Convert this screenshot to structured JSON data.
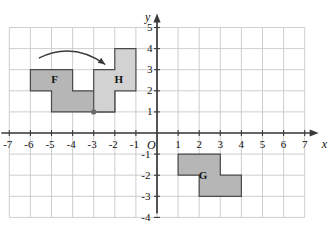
{
  "figure": {
    "kind": "coordinate-plane-transformation-diagram",
    "background_color": "#ffffff",
    "grid_color": "#c8c8c8",
    "axis_color": "#3a3a3a",
    "text_color": "#111111"
  },
  "axes": {
    "x_label": "x",
    "y_label": "y",
    "origin_label": "O",
    "x_min": -7,
    "x_max": 7,
    "y_min": -4,
    "y_max": 5,
    "x_ticks": [
      "-7",
      "-6",
      "-5",
      "-4",
      "-3",
      "-2",
      "-1",
      "1",
      "2",
      "3",
      "4",
      "5",
      "6",
      "7"
    ],
    "x_tick_values": [
      -7,
      -6,
      -5,
      -4,
      -3,
      -2,
      -1,
      1,
      2,
      3,
      4,
      5,
      6,
      7
    ],
    "y_ticks": [
      "5",
      "4",
      "3",
      "2",
      "1",
      "-1",
      "-2",
      "-3",
      "-4"
    ],
    "y_tick_values": [
      5,
      4,
      3,
      2,
      1,
      -1,
      -2,
      -3,
      -4
    ],
    "grid": true,
    "grid_x_range": [
      -7,
      7
    ],
    "grid_y_range": [
      -4,
      5
    ]
  },
  "shapes": [
    {
      "id": "F",
      "label": "F",
      "fill": "#b6b6b6",
      "stroke": "#4a4a4a",
      "label_point": [
        -4.85,
        2.5
      ],
      "vertices": [
        [
          -6,
          3
        ],
        [
          -4,
          3
        ],
        [
          -4,
          2
        ],
        [
          -2,
          2
        ],
        [
          -2,
          1
        ],
        [
          -5,
          1
        ],
        [
          -5,
          2
        ],
        [
          -6,
          2
        ]
      ]
    },
    {
      "id": "H",
      "label": "H",
      "fill": "#d2d2d2",
      "stroke": "#4a4a4a",
      "label_point": [
        -1.85,
        2.5
      ],
      "vertices": [
        [
          -2,
          4
        ],
        [
          -1,
          4
        ],
        [
          -1,
          2
        ],
        [
          -2,
          2
        ],
        [
          -2,
          1
        ],
        [
          -3,
          1
        ],
        [
          -3,
          3
        ],
        [
          -2,
          3
        ]
      ]
    },
    {
      "id": "G",
      "label": "G",
      "fill": "#b6b6b6",
      "stroke": "#4a4a4a",
      "label_point": [
        2.15,
        -2.05
      ],
      "vertices": [
        [
          1,
          -1
        ],
        [
          3,
          -1
        ],
        [
          3,
          -2
        ],
        [
          4,
          -2
        ],
        [
          4,
          -3
        ],
        [
          2,
          -3
        ],
        [
          2,
          -2
        ],
        [
          1,
          -2
        ]
      ]
    }
  ],
  "annotations": {
    "pivot_point": {
      "name": "pivot-dot",
      "x": -3,
      "y": 1,
      "color": "#6a6a6a",
      "radius": 2.6
    },
    "rotation_arrow": {
      "name": "rotation-arrow",
      "color": "#3a3a3a",
      "start": [
        -5.6,
        3.55
      ],
      "control": [
        -4.0,
        4.35
      ],
      "end": [
        -2.45,
        3.25
      ]
    }
  }
}
